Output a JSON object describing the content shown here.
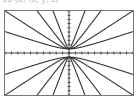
{
  "caption": "18 (a) (x, y, z)",
  "screen": {
    "description": "Graphing calculator window showing a family of hyperbolas",
    "colors": {
      "curve": "#333333",
      "axis": "#444444",
      "frame": "#777777"
    }
  },
  "chart_data": {
    "type": "line",
    "title": "",
    "xlabel": "",
    "ylabel": "",
    "xlim": [
      -10,
      10
    ],
    "ylim": [
      -10,
      10
    ],
    "axes_ticks": true,
    "grid": false,
    "legend": "none",
    "series": [
      {
        "name": "y^2 - 0.25x^2 = 1",
        "k": 0.25
      },
      {
        "name": "y^2 - 1x^2 = 1",
        "k": 1
      },
      {
        "name": "y^2 - 4x^2 = 1",
        "k": 4
      },
      {
        "name": "y^2 - 16x^2 = 1",
        "k": 16
      }
    ]
  }
}
